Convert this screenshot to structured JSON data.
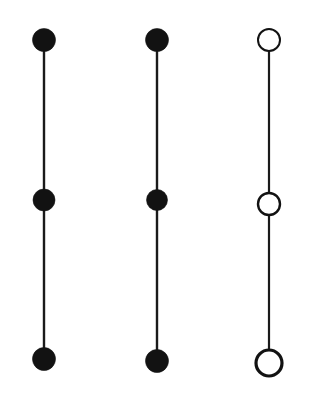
{
  "figure": {
    "background_color": "#ffffff",
    "ink_color": "#121212",
    "width": 318,
    "height": 410,
    "columns": [
      {
        "id": "column-left",
        "label": "Left chain",
        "node_style": "filled",
        "center_x": 44,
        "stem": {
          "x": 44,
          "y_top": 40,
          "y_bottom": 359,
          "width": 2.4
        },
        "nodes": [
          {
            "id": "node-left-top",
            "position": "top",
            "cx": 44,
            "cy": 40,
            "r": 11.5
          },
          {
            "id": "node-left-middle",
            "position": "middle",
            "cx": 44,
            "cy": 200,
            "r": 11.0
          },
          {
            "id": "node-left-bottom",
            "position": "bottom",
            "cx": 44,
            "cy": 359,
            "r": 11.5
          }
        ]
      },
      {
        "id": "column-middle",
        "label": "Middle chain",
        "node_style": "filled",
        "center_x": 157,
        "stem": {
          "x": 157,
          "y_top": 40,
          "y_bottom": 361,
          "width": 2.4
        },
        "nodes": [
          {
            "id": "node-middle-top",
            "position": "top",
            "cx": 157,
            "cy": 40,
            "r": 11.5
          },
          {
            "id": "node-middle-middle",
            "position": "middle",
            "cx": 157,
            "cy": 200,
            "r": 10.5
          },
          {
            "id": "node-middle-bottom",
            "position": "bottom",
            "cx": 157,
            "cy": 361,
            "r": 11.5
          }
        ]
      },
      {
        "id": "column-right",
        "label": "Right chain",
        "node_style": "hollow",
        "center_x": 269,
        "stem": {
          "x": 269,
          "y_top": 40,
          "y_bottom": 363,
          "width": 2.2
        },
        "nodes": [
          {
            "id": "node-right-top",
            "position": "top",
            "cx": 269,
            "cy": 40,
            "r": 11.0,
            "stroke_width": 2.0
          },
          {
            "id": "node-right-middle",
            "position": "middle",
            "cx": 269,
            "cy": 204,
            "r": 11.0,
            "stroke_width": 2.4
          },
          {
            "id": "node-right-bottom",
            "position": "bottom",
            "cx": 269,
            "cy": 363,
            "r": 13.0,
            "stroke_width": 3.2
          }
        ]
      }
    ]
  }
}
